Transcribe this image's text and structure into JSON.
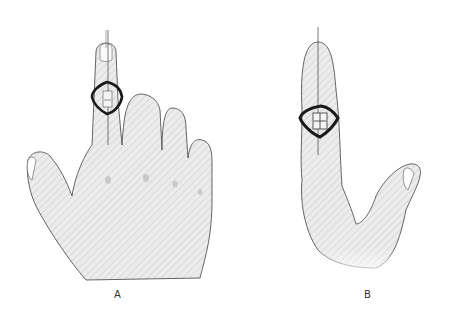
{
  "figure": {
    "panels": [
      {
        "label": "A",
        "view": "dorsal view of hand with index finger extended and ring splint on proximal interphalangeal joint"
      },
      {
        "label": "B",
        "view": "lateral view of hand with index finger extended and ring splint on finger"
      }
    ],
    "colors": {
      "skin_fill": "#ececec",
      "hatch": "#d2d2d2",
      "outline": "#555555",
      "splint": "#1a1a1a",
      "background": "#ffffff"
    }
  }
}
